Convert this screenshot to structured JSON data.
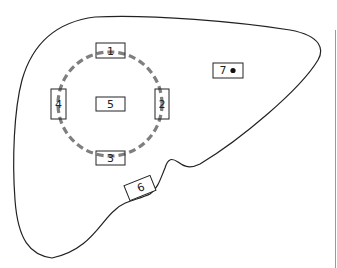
{
  "diagram": {
    "type": "liver segment sampling diagram",
    "outline_color": "#222222",
    "circle_color": "#7f7f7f",
    "labels": {
      "box1": "1",
      "box2": "2",
      "box3": "3",
      "box4": "4",
      "box5": "5",
      "box6": "6",
      "box7": "7"
    },
    "box7_marker": "filled-dot"
  }
}
